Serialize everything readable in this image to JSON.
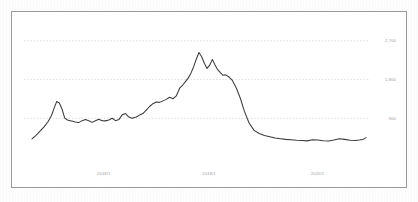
{
  "chart_data": {
    "type": "line",
    "title": "",
    "xlabel": "",
    "ylabel": "",
    "grid": true,
    "legend": false,
    "series_color": "#3b3b3b",
    "gridline_color": "#cfcfcf",
    "axis_label_color": "#9c9c9c",
    "border_color": "#9a9a9a",
    "background_color": "#ffffff",
    "page_background_color": "#fdfdfd",
    "ylim": [
      0,
      3000
    ],
    "yticks": [
      900,
      1800,
      2700
    ],
    "ytick_labels": [
      "900",
      "1,800",
      "2,700"
    ],
    "xtick_labels": [
      "2018/1",
      "2019/1",
      "2020/1"
    ],
    "xtick_positions": [
      0.215,
      0.53,
      0.855
    ],
    "x": [
      0.0,
      0.012,
      0.024,
      0.036,
      0.048,
      0.058,
      0.066,
      0.074,
      0.082,
      0.09,
      0.098,
      0.106,
      0.114,
      0.122,
      0.13,
      0.14,
      0.15,
      0.16,
      0.17,
      0.18,
      0.19,
      0.2,
      0.21,
      0.22,
      0.23,
      0.24,
      0.25,
      0.26,
      0.27,
      0.28,
      0.29,
      0.3,
      0.312,
      0.322,
      0.332,
      0.342,
      0.352,
      0.362,
      0.372,
      0.382,
      0.392,
      0.402,
      0.412,
      0.422,
      0.432,
      0.442,
      0.452,
      0.46,
      0.468,
      0.476,
      0.484,
      0.492,
      0.5,
      0.508,
      0.516,
      0.524,
      0.532,
      0.54,
      0.548,
      0.556,
      0.564,
      0.572,
      0.58,
      0.59,
      0.6,
      0.612,
      0.624,
      0.636,
      0.65,
      0.665,
      0.68,
      0.696,
      0.712,
      0.728,
      0.744,
      0.76,
      0.776,
      0.792,
      0.808,
      0.824,
      0.84,
      0.856,
      0.872,
      0.888,
      0.904,
      0.92,
      0.936,
      0.952,
      0.968,
      0.98,
      0.99,
      1.0
    ],
    "values": [
      420,
      505,
      600,
      700,
      820,
      960,
      1130,
      1290,
      1255,
      1110,
      905,
      860,
      845,
      830,
      815,
      800,
      845,
      870,
      845,
      805,
      845,
      880,
      845,
      840,
      860,
      900,
      845,
      870,
      980,
      1010,
      930,
      900,
      930,
      975,
      1010,
      1090,
      1175,
      1240,
      1280,
      1270,
      1305,
      1340,
      1390,
      1355,
      1420,
      1600,
      1680,
      1760,
      1840,
      1950,
      2100,
      2280,
      2430,
      2330,
      2180,
      2060,
      2135,
      2270,
      2140,
      2030,
      1960,
      1900,
      1910,
      1860,
      1780,
      1600,
      1360,
      1060,
      790,
      620,
      545,
      500,
      470,
      440,
      425,
      410,
      400,
      390,
      385,
      375,
      400,
      395,
      380,
      370,
      395,
      425,
      410,
      390,
      385,
      395,
      405,
      450
    ]
  }
}
